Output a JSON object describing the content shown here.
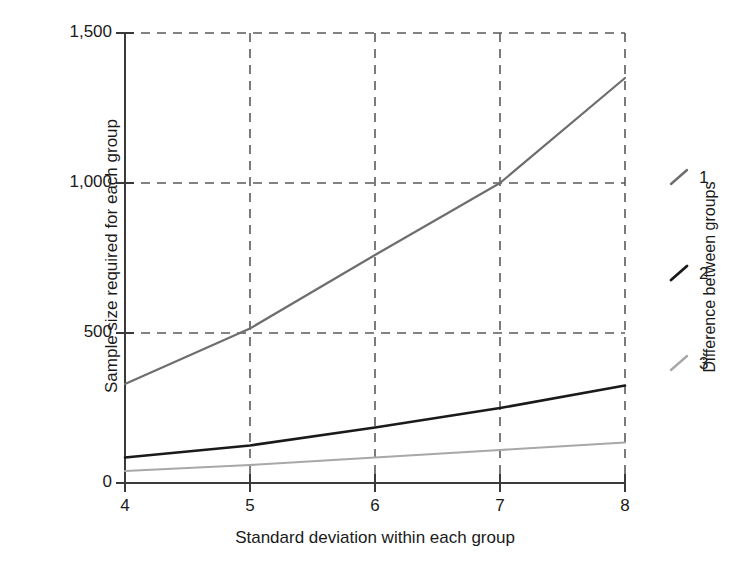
{
  "chart_data": {
    "type": "line",
    "title": "",
    "xlabel": "Standard deviation within each group",
    "ylabel": "Sample size required for each group",
    "x": [
      4,
      5,
      6,
      7,
      8
    ],
    "xlim": [
      4,
      8
    ],
    "ylim": [
      0,
      1500
    ],
    "xticks": [
      "4",
      "5",
      "6",
      "7",
      "8"
    ],
    "yticks": [
      "0",
      "500",
      "1,000",
      "1,500"
    ],
    "ytick_values": [
      0,
      500,
      1000,
      1500
    ],
    "grid": "dashed gridlines at each x tick and each y tick",
    "legend_position": "right",
    "legend_title": "Difference between groups",
    "series": [
      {
        "name": "1",
        "label": "1",
        "color": "#6e6e6e",
        "values": [
          330,
          515,
          760,
          1000,
          1350
        ]
      },
      {
        "name": "2",
        "label": "2",
        "color": "#1a1a1a",
        "values": [
          85,
          125,
          185,
          250,
          325
        ]
      },
      {
        "name": "3",
        "label": "3",
        "color": "#a8a8a8",
        "values": [
          40,
          60,
          85,
          110,
          135
        ]
      }
    ]
  },
  "axes": {
    "x_title": "Standard deviation within each group",
    "y_title": "Sample size required for each group",
    "y_tick_labels": [
      "1,500",
      "1,000",
      "500",
      "0"
    ],
    "x_tick_labels": [
      "4",
      "5",
      "6",
      "7",
      "8"
    ]
  },
  "legend": {
    "title": "Difference between groups",
    "items": [
      {
        "label": "1",
        "color": "#6e6e6e"
      },
      {
        "label": "2",
        "color": "#1a1a1a"
      },
      {
        "label": "3",
        "color": "#a8a8a8"
      }
    ]
  },
  "colors": {
    "axis": "#3a3a3a",
    "grid": "#5a5a5a",
    "series1": "#6e6e6e",
    "series2": "#1a1a1a",
    "series3": "#a8a8a8",
    "background": "#ffffff"
  }
}
